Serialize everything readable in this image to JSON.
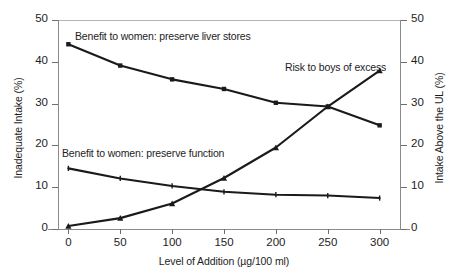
{
  "chart_data": {
    "type": "line",
    "title": "",
    "xlabel": "Level of Addition (µg/100 ml)",
    "ylabel": "Inadequate Intake (%)",
    "ylabel_right": "Intake Above the UL (%)",
    "x": [
      0,
      50,
      100,
      150,
      200,
      250,
      300
    ],
    "xlim": [
      -10,
      310
    ],
    "ylim": [
      0,
      50
    ],
    "ylim_right": [
      0,
      50
    ],
    "xticks": [
      "0",
      "50",
      "100",
      "150",
      "200",
      "250",
      "300"
    ],
    "yticks_left": [
      "0",
      "10",
      "20",
      "30",
      "40",
      "50"
    ],
    "yticks_right": [
      "0",
      "10",
      "20",
      "30",
      "40",
      "50"
    ],
    "grid": false,
    "legend_position": "inline-annotations",
    "series": [
      {
        "name": "Benefit to women: preserve liver stores",
        "axis": "left",
        "marker": "square",
        "color": "#1a1a1a",
        "values": [
          44.2,
          39.1,
          35.8,
          33.5,
          30.2,
          29.3,
          24.8
        ]
      },
      {
        "name": "Benefit to women: preserve function",
        "axis": "left",
        "marker": "tick",
        "color": "#1a1a1a",
        "values": [
          14.5,
          12.1,
          10.3,
          8.9,
          8.2,
          8.0,
          7.4
        ]
      },
      {
        "name": "Risk to boys of excess",
        "axis": "right",
        "marker": "triangle",
        "color": "#1a1a1a",
        "values": [
          0.7,
          2.6,
          6.1,
          12.2,
          19.5,
          29.3,
          37.9
        ]
      }
    ],
    "annotations": [
      {
        "text": "Benefit to women: preserve liver stores"
      },
      {
        "text": "Risk to boys of excess"
      },
      {
        "text": "Benefit to women: preserve function"
      }
    ]
  }
}
